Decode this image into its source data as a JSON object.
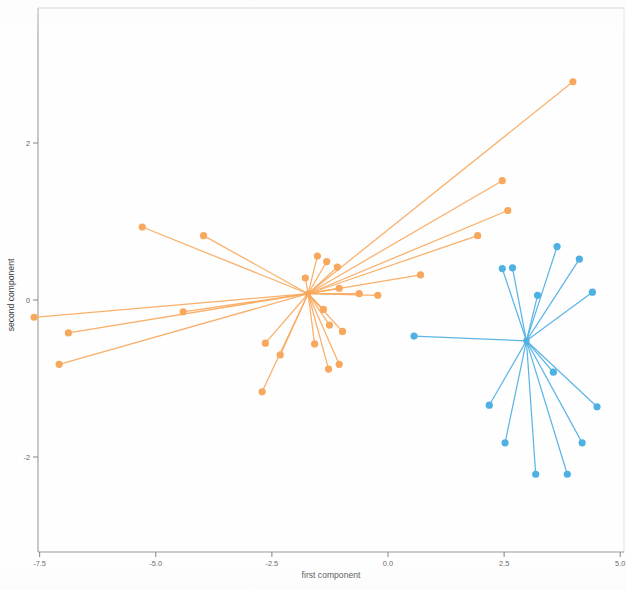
{
  "chart_data": {
    "type": "scatter",
    "title": "",
    "xlabel": "first component",
    "ylabel": "second component",
    "xlim": [
      -8.2,
      5.4
    ],
    "ylim": [
      -2.7,
      3.1
    ],
    "xticks": [
      -7.5,
      -5.0,
      -2.5,
      0.0,
      2.5,
      5.0
    ],
    "xticklabels": [
      "-7.5",
      "-5.0",
      "-2.5",
      "0.0",
      "2.5",
      "5.0"
    ],
    "yticks": [
      2,
      0,
      -2
    ],
    "yticklabels": [
      "2",
      "0",
      "-2"
    ],
    "grid": false,
    "legend": "none",
    "series": [
      {
        "name": "cluster-orange",
        "color": "#f8a85c",
        "center": [
          -1.72,
          0.08
        ],
        "points": [
          [
            3.98,
            2.78
          ],
          [
            2.46,
            1.52
          ],
          [
            2.58,
            1.14
          ],
          [
            1.93,
            0.82
          ],
          [
            0.7,
            0.32
          ],
          [
            -0.62,
            0.08
          ],
          [
            -1.05,
            0.15
          ],
          [
            -0.22,
            0.06
          ],
          [
            -1.32,
            0.49
          ],
          [
            -1.09,
            0.42
          ],
          [
            -1.52,
            0.56
          ],
          [
            -1.78,
            0.28
          ],
          [
            -1.39,
            -0.12
          ],
          [
            -1.26,
            -0.32
          ],
          [
            -0.98,
            -0.4
          ],
          [
            -1.58,
            -0.56
          ],
          [
            -1.28,
            -0.88
          ],
          [
            -1.05,
            -0.82
          ],
          [
            -2.32,
            -0.7
          ],
          [
            -2.64,
            -0.55
          ],
          [
            -2.71,
            -1.17
          ],
          [
            -3.97,
            0.82
          ],
          [
            -4.41,
            -0.15
          ],
          [
            -5.29,
            0.93
          ],
          [
            -6.88,
            -0.42
          ],
          [
            -7.62,
            -0.22
          ],
          [
            -7.08,
            -0.82
          ]
        ]
      },
      {
        "name": "cluster-blue",
        "color": "#4fb0e4",
        "center": [
          2.98,
          -0.52
        ],
        "points": [
          [
            3.64,
            0.68
          ],
          [
            2.46,
            0.4
          ],
          [
            2.68,
            0.41
          ],
          [
            4.12,
            0.52
          ],
          [
            3.22,
            0.06
          ],
          [
            4.4,
            0.1
          ],
          [
            0.56,
            -0.46
          ],
          [
            3.56,
            -0.92
          ],
          [
            4.5,
            -1.36
          ],
          [
            2.18,
            -1.34
          ],
          [
            2.52,
            -1.82
          ],
          [
            3.18,
            -2.22
          ],
          [
            4.18,
            -1.82
          ],
          [
            3.86,
            -2.22
          ]
        ]
      }
    ]
  },
  "axes": {
    "xlabel": "first component",
    "ylabel": "second component"
  }
}
